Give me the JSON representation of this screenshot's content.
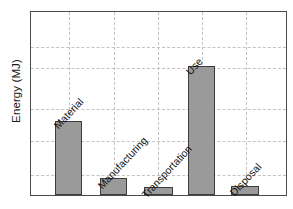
{
  "chart_data": {
    "type": "bar",
    "title": "",
    "xlabel": "",
    "ylabel": "Energy (MJ)",
    "categories": [
      "Material",
      "Manufacturing",
      "Transportation",
      "Use",
      "Disposal"
    ],
    "values": [
      40.5,
      9.2,
      4.3,
      70.3,
      4.9
    ],
    "ylim": [
      0,
      100
    ],
    "grid": true,
    "legend": false,
    "tick_labels_y": [],
    "tick_labels_x": [],
    "gridlines_y_count": 5,
    "gridlines_x_count": 5,
    "bar_color": "#9a9a9a",
    "bar_edge_color": "#3c3c3c",
    "grid_color": "#c3c3c3",
    "axis_color": "#4a4a4a",
    "label_rotation": -47
  },
  "axis": {
    "ylabel": "Energy (MJ)"
  },
  "bars": [
    {
      "label": "Material",
      "value": 40.5
    },
    {
      "label": "Manufacturing",
      "value": 9.2
    },
    {
      "label": "Transportation",
      "value": 4.3
    },
    {
      "label": "Use",
      "value": 70.3
    },
    {
      "label": "Disposal",
      "value": 4.9
    }
  ]
}
